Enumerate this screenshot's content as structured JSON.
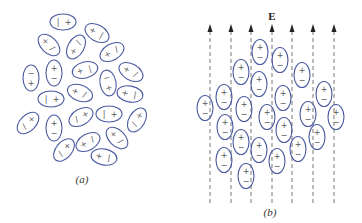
{
  "figure": {
    "panel_a": {
      "label": "(a)",
      "description": "Randomly oriented polar molecules (no field)",
      "molecules": [
        {
          "cx": 63,
          "cy": 22,
          "rx": 13,
          "ry": 8,
          "rot": 0,
          "a": "|",
          "b": "+"
        },
        {
          "cx": 97,
          "cy": 33,
          "rx": 13,
          "ry": 8,
          "rot": 30,
          "a": "+",
          "b": "|"
        },
        {
          "cx": 49,
          "cy": 45,
          "rx": 13,
          "ry": 8,
          "rot": 45,
          "a": "+",
          "b": "/"
        },
        {
          "cx": 76,
          "cy": 47,
          "rx": 13,
          "ry": 8,
          "rot": -60,
          "a": "+",
          "b": "/"
        },
        {
          "cx": 112,
          "cy": 52,
          "rx": 13,
          "ry": 8,
          "rot": -30,
          "a": "+",
          "b": "/"
        },
        {
          "cx": 31,
          "cy": 78,
          "rx": 8,
          "ry": 13,
          "rot": 0,
          "a": "−",
          "b": "+"
        },
        {
          "cx": 54,
          "cy": 73,
          "rx": 8,
          "ry": 13,
          "rot": 0,
          "a": "+",
          "b": "−"
        },
        {
          "cx": 85,
          "cy": 70,
          "rx": 13,
          "ry": 8,
          "rot": -15,
          "a": "+",
          "b": "|"
        },
        {
          "cx": 108,
          "cy": 83,
          "rx": 8,
          "ry": 13,
          "rot": -10,
          "a": "−",
          "b": "+"
        },
        {
          "cx": 131,
          "cy": 72,
          "rx": 13,
          "ry": 8,
          "rot": 30,
          "a": "+",
          "b": "/"
        },
        {
          "cx": 51,
          "cy": 99,
          "rx": 13,
          "ry": 8,
          "rot": 0,
          "a": "|",
          "b": "+"
        },
        {
          "cx": 80,
          "cy": 93,
          "rx": 13,
          "ry": 8,
          "rot": 20,
          "a": "+",
          "b": "/"
        },
        {
          "cx": 130,
          "cy": 94,
          "rx": 13,
          "ry": 8,
          "rot": 10,
          "a": "+",
          "b": "|"
        },
        {
          "cx": 28,
          "cy": 123,
          "rx": 13,
          "ry": 8,
          "rot": -45,
          "a": "/",
          "b": "+"
        },
        {
          "cx": 54,
          "cy": 128,
          "rx": 8,
          "ry": 13,
          "rot": 0,
          "a": "+",
          "b": "−"
        },
        {
          "cx": 81,
          "cy": 117,
          "rx": 13,
          "ry": 8,
          "rot": -30,
          "a": "/",
          "b": "+"
        },
        {
          "cx": 109,
          "cy": 114,
          "rx": 13,
          "ry": 8,
          "rot": 0,
          "a": "|",
          "b": "+"
        },
        {
          "cx": 137,
          "cy": 120,
          "rx": 13,
          "ry": 8,
          "rot": -60,
          "a": "/",
          "b": "+"
        },
        {
          "cx": 64,
          "cy": 150,
          "rx": 13,
          "ry": 8,
          "rot": -50,
          "a": "/",
          "b": "+"
        },
        {
          "cx": 88,
          "cy": 142,
          "rx": 13,
          "ry": 8,
          "rot": -30,
          "a": "+",
          "b": "/"
        },
        {
          "cx": 117,
          "cy": 138,
          "rx": 13,
          "ry": 8,
          "rot": 45,
          "a": "+",
          "b": "/"
        },
        {
          "cx": 104,
          "cy": 157,
          "rx": 13,
          "ry": 8,
          "rot": 10,
          "a": "+",
          "b": "|"
        }
      ]
    },
    "panel_b": {
      "label": "(b)",
      "field_label": "E",
      "description": "Polar molecules aligned with applied electric field E",
      "field_lines_x": [
        210,
        231,
        251,
        272,
        292,
        313,
        334
      ],
      "field_top_y": 27,
      "field_bottom_y": 205,
      "molecules": [
        {
          "cx": 260,
          "cy": 52
        },
        {
          "cx": 280,
          "cy": 60
        },
        {
          "cx": 241,
          "cy": 72
        },
        {
          "cx": 302,
          "cy": 75
        },
        {
          "cx": 259,
          "cy": 84
        },
        {
          "cx": 224,
          "cy": 97
        },
        {
          "cx": 324,
          "cy": 94
        },
        {
          "cx": 283,
          "cy": 98
        },
        {
          "cx": 205,
          "cy": 108
        },
        {
          "cx": 244,
          "cy": 109
        },
        {
          "cx": 308,
          "cy": 114
        },
        {
          "cx": 336,
          "cy": 117
        },
        {
          "cx": 267,
          "cy": 117
        },
        {
          "cx": 225,
          "cy": 127
        },
        {
          "cx": 284,
          "cy": 130
        },
        {
          "cx": 317,
          "cy": 137
        },
        {
          "cx": 241,
          "cy": 142
        },
        {
          "cx": 259,
          "cy": 150
        },
        {
          "cx": 298,
          "cy": 149
        },
        {
          "cx": 224,
          "cy": 160
        },
        {
          "cx": 277,
          "cy": 161
        },
        {
          "cx": 246,
          "cy": 176
        }
      ],
      "positive_symbol": "+",
      "negative_symbol": "−"
    }
  }
}
